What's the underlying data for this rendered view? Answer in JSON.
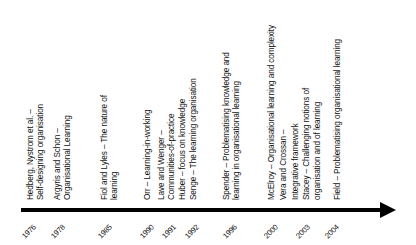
{
  "diagram": {
    "type": "timeline",
    "axis_color": "#000000",
    "entries": [
      {
        "year": "1976",
        "lines": [
          "Hedberg, Nystrom et al. –",
          "Self-designing organisation"
        ]
      },
      {
        "year": "1978",
        "lines": [
          "Argyris and Schon –",
          "Organisational Learning"
        ]
      },
      {
        "year": "1985",
        "lines": [
          "Fiol and Lyles – The nature of",
          "learning"
        ]
      },
      {
        "year": "1990",
        "lines": [
          "Orr – Learning-in-working"
        ]
      },
      {
        "year": "1991",
        "lines": [
          "Lave and Wenger –",
          "Communities-of-practice",
          "Huber – focus on knowledge"
        ]
      },
      {
        "year": "1992",
        "lines": [
          "Senge – The learning organisation"
        ]
      },
      {
        "year": "1996",
        "lines": [
          "Spender – Problematising knowledge and",
          "learning in organisational learning"
        ]
      },
      {
        "year": "2000",
        "lines": [
          "McElroy – Organisational learning and complexity",
          "Vera and Crossan –",
          "Integrative framework"
        ]
      },
      {
        "year": "2003",
        "lines": [
          "Stacey – Challenging notions of",
          "organisation and of learning"
        ]
      },
      {
        "year": "2004",
        "lines": [
          "Field – Problematising organisational learning"
        ]
      }
    ]
  }
}
